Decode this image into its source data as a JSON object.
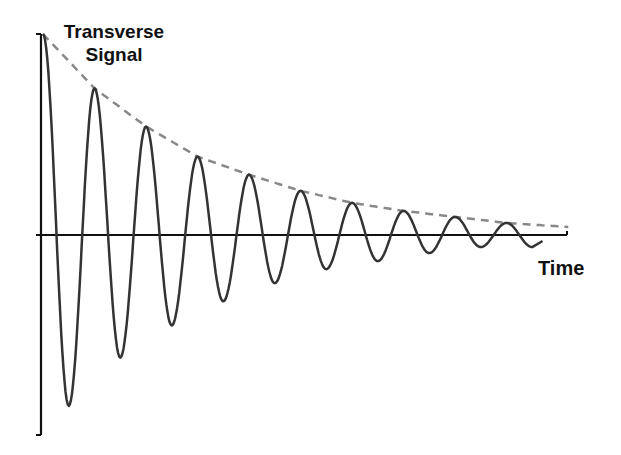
{
  "chart_data": {
    "type": "line",
    "title": "",
    "xlabel": "Time",
    "ylabel": "Transverse Signal",
    "ylabel_lines": [
      "Transverse",
      "Signal"
    ],
    "grid": false,
    "legend": null,
    "axes_units": "none (schematic, unlabeled ticks)",
    "series": [
      {
        "name": "damped oscillation",
        "style": "solid",
        "color": "#333333",
        "peaks": [
          {
            "x": 0.0,
            "y": 1.0
          },
          {
            "x": 1.0,
            "y": 0.73
          },
          {
            "x": 2.0,
            "y": 0.54
          },
          {
            "x": 3.0,
            "y": 0.39
          },
          {
            "x": 4.0,
            "y": 0.3
          },
          {
            "x": 5.0,
            "y": 0.22
          },
          {
            "x": 6.0,
            "y": 0.16
          },
          {
            "x": 7.0,
            "y": 0.12
          },
          {
            "x": 8.0,
            "y": 0.09
          },
          {
            "x": 9.0,
            "y": 0.06
          }
        ],
        "troughs": [
          {
            "x": 0.5,
            "y": -0.85
          },
          {
            "x": 1.5,
            "y": -0.61
          },
          {
            "x": 2.5,
            "y": -0.45
          },
          {
            "x": 3.5,
            "y": -0.33
          },
          {
            "x": 4.5,
            "y": -0.24
          },
          {
            "x": 5.5,
            "y": -0.17
          },
          {
            "x": 6.5,
            "y": -0.13
          },
          {
            "x": 7.5,
            "y": -0.09
          },
          {
            "x": 8.5,
            "y": -0.06
          }
        ]
      },
      {
        "name": "exponential decay envelope",
        "style": "dashed",
        "color": "#888888",
        "x": [
          0,
          1,
          2,
          3,
          4,
          5,
          6,
          7,
          8,
          9,
          10.2
        ],
        "values": [
          1.0,
          0.73,
          0.54,
          0.39,
          0.3,
          0.22,
          0.16,
          0.12,
          0.09,
          0.06,
          0.04
        ]
      }
    ]
  },
  "labels": {
    "y_line1": "Transverse",
    "y_line2": "Signal",
    "x": "Time"
  }
}
